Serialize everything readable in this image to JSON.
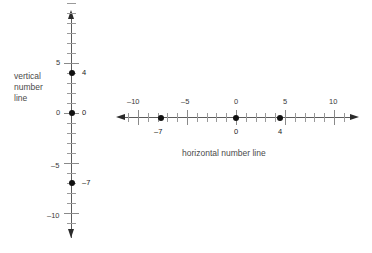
{
  "figure": {
    "background_color": "#ffffff",
    "axis_color": "#5b5b5b",
    "tick_color": "#9a9a9a",
    "point_color": "#111111",
    "label_color": "#4a4a4a"
  },
  "vertical": {
    "caption_line1": "vertical",
    "caption_line2": "number",
    "caption_line3": "line",
    "axis_labels": {
      "pos5": "5",
      "zero": "0",
      "neg5": "–5",
      "neg10": "–10"
    },
    "point_labels": {
      "p4": "4",
      "p0": "0",
      "pneg7": "–7"
    }
  },
  "horizontal": {
    "caption": "horizontal number line",
    "axis_labels": {
      "neg10": "–10",
      "neg5": "–5",
      "zero": "0",
      "pos5": "5",
      "pos10": "10"
    },
    "point_labels": {
      "pneg7": "–7",
      "p0": "0",
      "p4": "4"
    }
  },
  "chart_data": [
    {
      "type": "scatter",
      "title": "vertical number line",
      "orientation": "vertical",
      "xlabel": "",
      "ylabel": "vertical number line",
      "ylim": [
        -12,
        12
      ],
      "grid": false,
      "legend": "none",
      "major_ticks": [
        -10,
        -5,
        0,
        5
      ],
      "major_tick_labels": [
        "–10",
        "–5",
        "0",
        "5"
      ],
      "minor_tick_interval": 1,
      "values": [
        4,
        0,
        -7
      ],
      "point_labels": [
        "4",
        "0",
        "–7"
      ],
      "axis_arrows": [
        "up",
        "down"
      ]
    },
    {
      "type": "scatter",
      "title": "horizontal number line",
      "orientation": "horizontal",
      "xlabel": "horizontal number line",
      "ylabel": "",
      "xlim": [
        -12,
        12
      ],
      "grid": false,
      "legend": "none",
      "major_ticks": [
        -10,
        -5,
        0,
        5,
        10
      ],
      "major_tick_labels": [
        "–10",
        "–5",
        "0",
        "5",
        "10"
      ],
      "minor_tick_interval": 1,
      "values": [
        -7,
        0,
        4
      ],
      "point_labels": [
        "–7",
        "0",
        "4"
      ],
      "axis_arrows": [
        "left",
        "right"
      ]
    }
  ]
}
